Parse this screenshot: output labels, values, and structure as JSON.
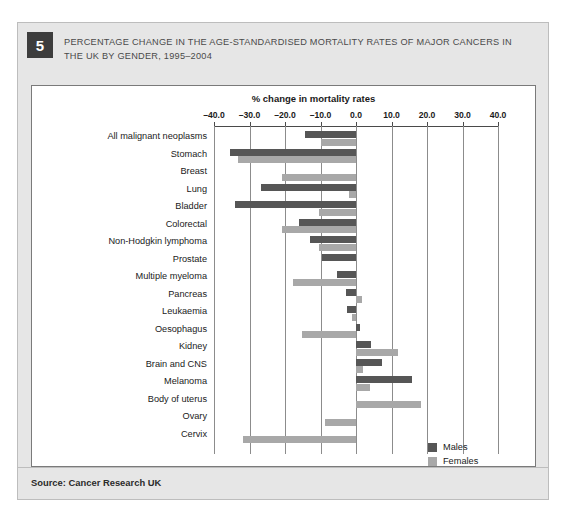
{
  "figure": {
    "number": "5",
    "title": "PERCENTAGE CHANGE IN THE AGE-STANDARDISED MORTALITY RATES OF MAJOR CANCERS IN THE UK BY GENDER, 1995–2004",
    "source": "Source: Cancer Research UK"
  },
  "colors": {
    "males": "#565656",
    "females": "#a8a8a8",
    "panel_background": "#e6e6e6",
    "plot_background": "#ffffff",
    "gridline": "#8c8c8c"
  },
  "chart_data": {
    "type": "bar",
    "orientation": "horizontal",
    "title": "% change in mortality rates",
    "xlabel": "% change in mortality rates",
    "ylabel": "",
    "xlim": [
      -40.0,
      40.0
    ],
    "xticks": [
      -40.0,
      -30.0,
      -20.0,
      -10.0,
      0.0,
      10.0,
      20.0,
      30.0,
      40.0
    ],
    "xtick_labels": [
      "–40.0",
      "–30.0",
      "–20.0",
      "–10.0",
      "0.0",
      "10.0",
      "20.0",
      "30.0",
      "40.0"
    ],
    "grid": true,
    "legend_position": "right",
    "categories": [
      "All malignant neoplasms",
      "Stomach",
      "Breast",
      "Lung",
      "Bladder",
      "Colorectal",
      "Non-Hodgkin lymphoma",
      "Prostate",
      "Multiple myeloma",
      "Pancreas",
      "Leukaemia",
      "Oesophagus",
      "Kidney",
      "Brain and CNS",
      "Melanoma",
      "Body of uterus",
      "Ovary",
      "Cervix"
    ],
    "series": [
      {
        "name": "Males",
        "color": "#565656",
        "values": [
          -14.4,
          -35.5,
          null,
          -26.8,
          -34.0,
          -16.0,
          -13.0,
          -9.5,
          -5.4,
          -2.9,
          -2.6,
          1.0,
          4.2,
          7.3,
          15.8,
          null,
          null,
          null
        ]
      },
      {
        "name": "Females",
        "color": "#a8a8a8",
        "values": [
          -9.9,
          -33.2,
          -20.8,
          -2.0,
          -10.4,
          -20.8,
          -10.4,
          null,
          -17.7,
          1.7,
          -1.0,
          -15.2,
          11.8,
          2.0,
          4.0,
          18.3,
          -8.7,
          -31.8
        ]
      }
    ]
  },
  "legend": {
    "items": [
      {
        "label": "Males",
        "key": "males"
      },
      {
        "label": "Females",
        "key": "females"
      }
    ]
  }
}
